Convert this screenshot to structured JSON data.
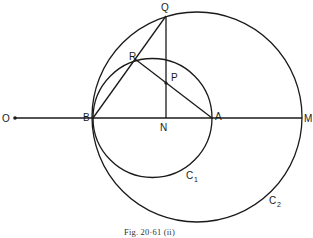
{
  "figure": {
    "caption": "Fig. 20·61 (ii)",
    "points": {
      "O": "O",
      "B": "B",
      "N": "N",
      "A": "A",
      "M": "M",
      "Q": "Q",
      "R": "R",
      "P": "P"
    },
    "circles": {
      "c1": {
        "label": "C",
        "sub": "1"
      },
      "c2": {
        "label": "C",
        "sub": "2"
      }
    },
    "colors": {
      "line": "#1a1a1a",
      "background": "#ffffff"
    }
  }
}
